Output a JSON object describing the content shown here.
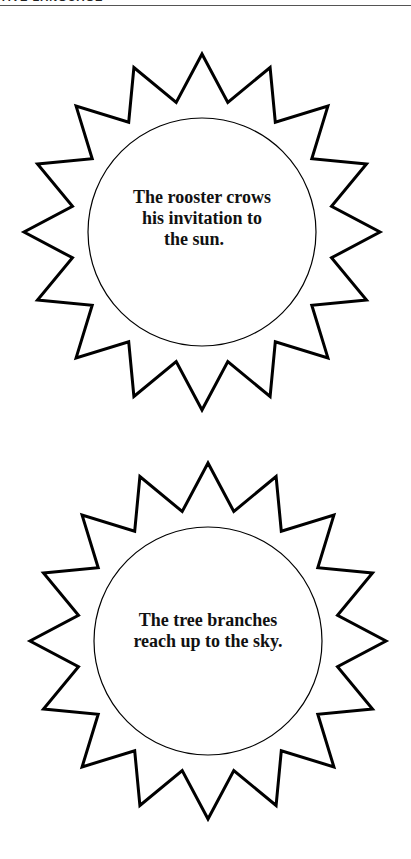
{
  "header": {
    "title": "TIVE LANGUAGE"
  },
  "suns": [
    {
      "lines": [
        "The rooster crows",
        "his invitation to",
        "the sun."
      ],
      "points": 16,
      "center": [
        202,
        232
      ],
      "inner_radius": 114,
      "ray_outer": 178,
      "ray_inner": 132
    },
    {
      "lines": [
        "The tree branches",
        "reach up to the sky."
      ],
      "points": 16,
      "center": [
        208,
        641
      ],
      "inner_radius": 114,
      "ray_outer": 178,
      "ray_inner": 132
    }
  ],
  "colors": {
    "stroke": "#000000",
    "background": "#ffffff"
  }
}
